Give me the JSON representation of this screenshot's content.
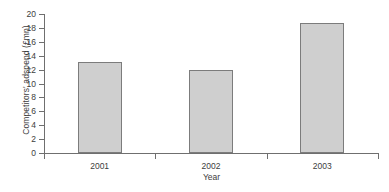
{
  "chart_data": {
    "type": "bar",
    "title": "",
    "xlabel": "Year",
    "ylabel": "Competitors' adspend (£mn)",
    "categories": [
      "2001",
      "2002",
      "2003"
    ],
    "values": [
      13.1,
      12.0,
      18.7
    ],
    "series": [
      {
        "name": "Competitors' adspend",
        "values": [
          13.1,
          12.0,
          18.7
        ]
      }
    ],
    "ylim": [
      0,
      20
    ],
    "ytick_labels": [
      "20",
      "18",
      "16",
      "14",
      "12",
      "10",
      "8",
      "6",
      "4",
      "2",
      "0"
    ],
    "ytick_values": [
      20,
      18,
      16,
      14,
      12,
      10,
      8,
      6,
      4,
      2,
      0
    ],
    "ytick_step": 2,
    "grid": false,
    "legend": false,
    "legend_position": "none",
    "bar_fill_color": "#cfcfcf",
    "bar_border_color": "#7c7c7c",
    "axis_color": "#6f6f6f",
    "text_color": "#3d3d3d"
  },
  "caption": ""
}
